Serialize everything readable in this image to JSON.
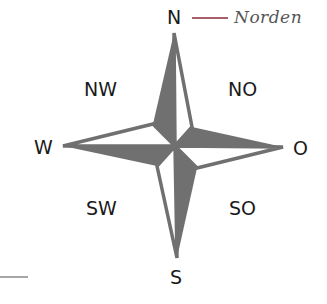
{
  "diagram": {
    "type": "compass-rose",
    "labels": {
      "n": "N",
      "nw": "NW",
      "no": "NO",
      "w": "W",
      "o": "O",
      "sw": "SW",
      "so": "SO",
      "s": "S"
    },
    "annotation": {
      "text": "Norden",
      "target": "N"
    },
    "colors": {
      "star_fill": "#707070",
      "star_outline": "#707070",
      "annotation_line": "#8a2a3a",
      "annotation_text": "#555555",
      "label_text": "#1a1a1a",
      "bottom_rule": "#888888"
    }
  }
}
